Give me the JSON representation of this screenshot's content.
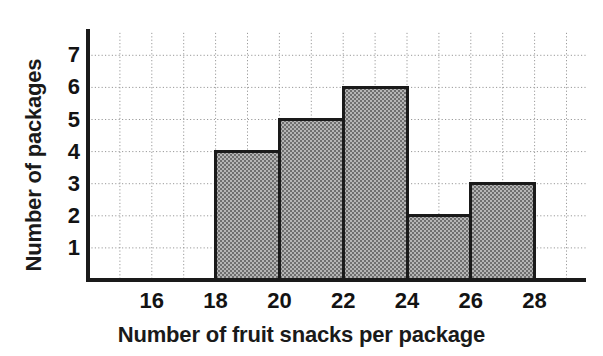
{
  "chart_data": {
    "type": "bar",
    "title": "",
    "subtitle": "",
    "xlabel": "Number of fruit snacks per package",
    "ylabel": "Number of packages",
    "bin_edges": [
      18,
      20,
      22,
      24,
      26,
      28
    ],
    "bins": [
      {
        "label": "18-20",
        "start": 18,
        "end": 20,
        "value": 4
      },
      {
        "label": "20-22",
        "start": 20,
        "end": 22,
        "value": 5
      },
      {
        "label": "22-24",
        "start": 22,
        "end": 24,
        "value": 6
      },
      {
        "label": "24-26",
        "start": 24,
        "end": 26,
        "value": 2
      },
      {
        "label": "26-28",
        "start": 26,
        "end": 28,
        "value": 3
      }
    ],
    "categories": [
      "18-20",
      "20-22",
      "22-24",
      "24-26",
      "26-28"
    ],
    "values": [
      4,
      5,
      6,
      2,
      3
    ],
    "xticklabels": [
      "16",
      "18",
      "20",
      "22",
      "24",
      "26",
      "28"
    ],
    "xtickvalues": [
      16,
      18,
      20,
      22,
      24,
      26,
      28
    ],
    "yticklabels": [
      "1",
      "2",
      "3",
      "4",
      "5",
      "6",
      "7"
    ],
    "ytickvalues": [
      1,
      2,
      3,
      4,
      5,
      6,
      7
    ],
    "xlim": [
      14,
      29
    ],
    "ylim": [
      0,
      7.7
    ],
    "grid": true,
    "grid_style": "dotted",
    "legend": "none",
    "bar_fill": "#8f8f8f",
    "bar_edge": "#1a1a1a",
    "axis_color": "#1a1a1a",
    "grid_color": "#9a9a9a",
    "text_color": "#131313"
  },
  "labels": {
    "y_title": "Number of packages",
    "x_title": "Number of fruit snacks per package"
  }
}
